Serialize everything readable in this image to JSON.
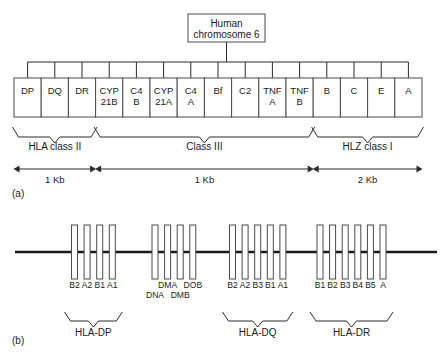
{
  "figure": {
    "title_box": {
      "line1": "Human",
      "line2": "chromosome 6"
    },
    "panel_a": {
      "label": "(a)",
      "genes": [
        {
          "line1": "DP",
          "line2": ""
        },
        {
          "line1": "DQ",
          "line2": ""
        },
        {
          "line1": "DR",
          "line2": ""
        },
        {
          "line1": "CYP",
          "line2": "21B"
        },
        {
          "line1": "C4",
          "line2": "B"
        },
        {
          "line1": "CYP",
          "line2": "21A"
        },
        {
          "line1": "C4",
          "line2": "A"
        },
        {
          "line1": "Bf",
          "line2": ""
        },
        {
          "line1": "C2",
          "line2": ""
        },
        {
          "line1": "TNF",
          "line2": "A"
        },
        {
          "line1": "TNF",
          "line2": "B"
        },
        {
          "line1": "B",
          "line2": ""
        },
        {
          "line1": "C",
          "line2": ""
        },
        {
          "line1": "E",
          "line2": ""
        },
        {
          "line1": "A",
          "line2": ""
        }
      ],
      "regions": [
        {
          "name": "HLA class II",
          "scale": "1 Kb",
          "first_gene": 0,
          "last_gene": 2
        },
        {
          "name": "Class III",
          "scale": "1 Kb",
          "first_gene": 3,
          "last_gene": 10
        },
        {
          "name": "HLZ class I",
          "scale": "2 Kb",
          "first_gene": 11,
          "last_gene": 14
        }
      ]
    },
    "panel_b": {
      "label": "(b)",
      "clusters": [
        {
          "name": "HLA-DP",
          "has_bracket": true,
          "genes": [
            {
              "label": "B2",
              "row": 0
            },
            {
              "label": "A2",
              "row": 0
            },
            {
              "label": "B1",
              "row": 0
            },
            {
              "label": "A1",
              "row": 0
            }
          ]
        },
        {
          "name": "",
          "has_bracket": false,
          "genes": [
            {
              "label": "DNA",
              "row": 1
            },
            {
              "label": "DMA",
              "row": 0
            },
            {
              "label": "DMB",
              "row": 1
            },
            {
              "label": "DOB",
              "row": 0
            }
          ]
        },
        {
          "name": "HLA-DQ",
          "has_bracket": true,
          "genes": [
            {
              "label": "B2",
              "row": 0
            },
            {
              "label": "A2",
              "row": 0
            },
            {
              "label": "B3",
              "row": 0
            },
            {
              "label": "B1",
              "row": 0
            },
            {
              "label": "A1",
              "row": 0
            }
          ]
        },
        {
          "name": "HLA-DR",
          "has_bracket": true,
          "genes": [
            {
              "label": "B1",
              "row": 0
            },
            {
              "label": "B2",
              "row": 0
            },
            {
              "label": "B3",
              "row": 0
            },
            {
              "label": "B4",
              "row": 0
            },
            {
              "label": "B5",
              "row": 0
            },
            {
              "label": "A",
              "row": 0
            }
          ]
        }
      ]
    },
    "colors": {
      "line": "#2b2b2b",
      "box_stroke": "#4a4a4a",
      "text": "#1a1a1a",
      "background": "#ffffff"
    }
  }
}
